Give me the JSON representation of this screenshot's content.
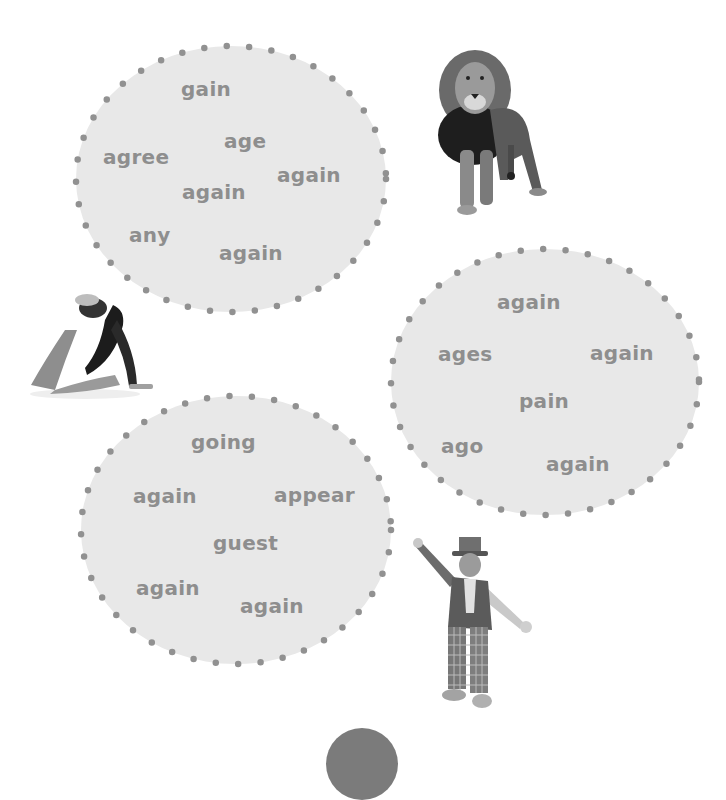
{
  "bubbles": [
    {
      "name": "bubble-1",
      "words": [
        {
          "text": "gain",
          "x": 181,
          "y": 79
        },
        {
          "text": "age",
          "x": 224,
          "y": 131
        },
        {
          "text": "agree",
          "x": 103,
          "y": 147
        },
        {
          "text": "again",
          "x": 277,
          "y": 165
        },
        {
          "text": "again",
          "x": 182,
          "y": 182
        },
        {
          "text": "any",
          "x": 129,
          "y": 225
        },
        {
          "text": "again",
          "x": 219,
          "y": 243
        }
      ]
    },
    {
      "name": "bubble-2",
      "words": [
        {
          "text": "again",
          "x": 497,
          "y": 292
        },
        {
          "text": "ages",
          "x": 438,
          "y": 344
        },
        {
          "text": "again",
          "x": 590,
          "y": 343
        },
        {
          "text": "pain",
          "x": 519,
          "y": 391
        },
        {
          "text": "ago",
          "x": 441,
          "y": 436
        },
        {
          "text": "again",
          "x": 546,
          "y": 454
        }
      ]
    },
    {
      "name": "bubble-3",
      "words": [
        {
          "text": "going",
          "x": 191,
          "y": 432
        },
        {
          "text": "again",
          "x": 133,
          "y": 486
        },
        {
          "text": "appear",
          "x": 274,
          "y": 485
        },
        {
          "text": "guest",
          "x": 213,
          "y": 533
        },
        {
          "text": "again",
          "x": 136,
          "y": 578
        },
        {
          "text": "again",
          "x": 240,
          "y": 596
        }
      ]
    }
  ],
  "pictures": [
    {
      "name": "lion-image",
      "label": "lion"
    },
    {
      "name": "gymnast-image",
      "label": "gymnast"
    },
    {
      "name": "clown-image",
      "label": "clown"
    }
  ],
  "colors": {
    "bubble_fill": "#e8e8e8",
    "dot": "#919191",
    "word": "#8e8e8e",
    "bottom_circle": "#7b7b7b"
  }
}
